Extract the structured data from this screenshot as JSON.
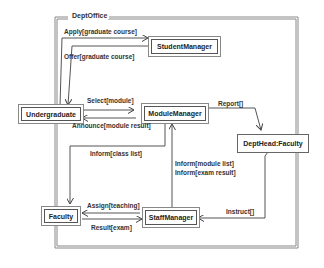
{
  "diagram": {
    "type": "UML collaboration / communication diagram",
    "frame": {
      "title": "DeptOffice"
    },
    "nodes": {
      "student_manager": "StudentManager",
      "undergraduate": "Undergraduate",
      "module_manager": "ModuleManager",
      "dept_head": "DeptHead:Faculty",
      "faculty": "Faculty",
      "staff_manager": "StaffManager"
    },
    "messages": {
      "apply": "Apply[graduate course]",
      "offer": "Offer[graduate course]",
      "select": "Select[module]",
      "announce": "Announce[module result]",
      "report": "Report[]",
      "inform_class": "Inform[class list]",
      "inform_module": "Inform[module list]",
      "inform_exam": "Inform[exam result]",
      "assign": "Assign[teaching]",
      "result": "Result[exam]",
      "instruct": "Instruct[]"
    },
    "colors": {
      "line": "#555555",
      "frame": "#888888",
      "background": "#ffffff"
    }
  }
}
